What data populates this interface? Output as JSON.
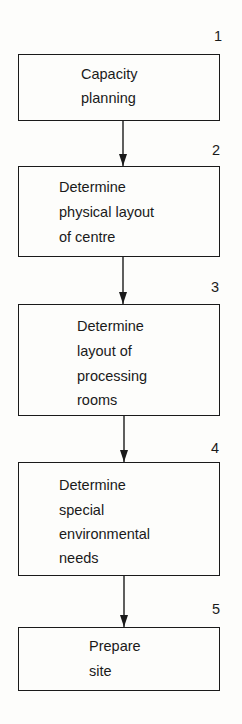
{
  "steps": [
    {
      "number": "1",
      "label_lines": [
        "Capacity",
        "planning"
      ]
    },
    {
      "number": "2",
      "label_lines": [
        "Determine",
        "physical layout",
        "of centre"
      ]
    },
    {
      "number": "3",
      "label_lines": [
        "Determine",
        "layout of",
        "processing",
        "rooms"
      ]
    },
    {
      "number": "4",
      "label_lines": [
        "Determine",
        "special",
        "environmental",
        "needs"
      ]
    },
    {
      "number": "5",
      "label_lines": [
        "Prepare",
        "site"
      ]
    }
  ]
}
